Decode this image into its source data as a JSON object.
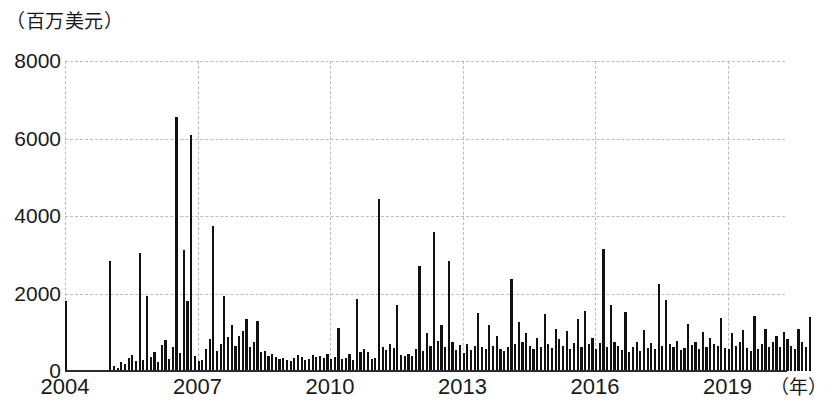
{
  "chart_data": {
    "type": "bar",
    "title": "",
    "subtitle": "",
    "ylabel": "（百万美元）",
    "xlabel": "（年）",
    "ylim": [
      0,
      8000
    ],
    "ytick_labels": [
      "0",
      "2000",
      "4000",
      "6000",
      "8000"
    ],
    "ytick_values": [
      0,
      2000,
      4000,
      6000,
      8000
    ],
    "xtick_labels": [
      "2004",
      "2007",
      "2010",
      "2013",
      "2016",
      "2019"
    ],
    "xtick_values": [
      2004,
      2007,
      2010,
      2013,
      2016,
      2019
    ],
    "xlim": [
      2004,
      2020.3
    ],
    "grid": "dashed-both",
    "legend": "none",
    "series_name": "monthly value",
    "x_start": 2004.0,
    "x_step": 0.08333,
    "values": [
      1800,
      0,
      0,
      0,
      0,
      0,
      0,
      0,
      0,
      0,
      0,
      0,
      2850,
      140,
      90,
      230,
      180,
      330,
      410,
      270,
      3050,
      290,
      1940,
      350,
      480,
      220,
      660,
      800,
      300,
      620,
      6550,
      460,
      3120,
      1800,
      6100,
      380,
      270,
      280,
      560,
      820,
      3750,
      520,
      700,
      1940,
      880,
      1190,
      640,
      900,
      1030,
      1350,
      620,
      740,
      1290,
      480,
      520,
      400,
      430,
      350,
      300,
      340,
      280,
      260,
      330,
      410,
      370,
      280,
      300,
      420,
      350,
      390,
      330,
      440,
      300,
      370,
      1100,
      310,
      330,
      430,
      280,
      1870,
      500,
      560,
      480,
      320,
      340,
      4450,
      620,
      540,
      700,
      590,
      1700,
      420,
      390,
      450,
      380,
      560,
      2700,
      520,
      980,
      640,
      3600,
      780,
      1190,
      620,
      2850,
      740,
      530,
      680,
      470,
      700,
      540,
      640,
      1500,
      620,
      580,
      1200,
      640,
      900,
      560,
      510,
      620,
      2380,
      700,
      1270,
      740,
      980,
      640,
      580,
      860,
      620,
      1470,
      700,
      600,
      1080,
      820,
      640,
      1020,
      560,
      720,
      1340,
      610,
      1560,
      700,
      840,
      560,
      720,
      3150,
      620,
      1700,
      760,
      640,
      530,
      1530,
      480,
      620,
      740,
      520,
      1060,
      600,
      720,
      560,
      2250,
      640,
      1830,
      700,
      620,
      780,
      540,
      600,
      1210,
      680,
      740,
      560,
      1010,
      620,
      850,
      700,
      640,
      1380,
      600,
      560,
      980,
      640,
      740,
      1060,
      600,
      520,
      1420,
      580,
      700,
      1080,
      620,
      740,
      900,
      620,
      1000,
      820,
      640,
      560,
      1080,
      740,
      620,
      1400
    ]
  }
}
